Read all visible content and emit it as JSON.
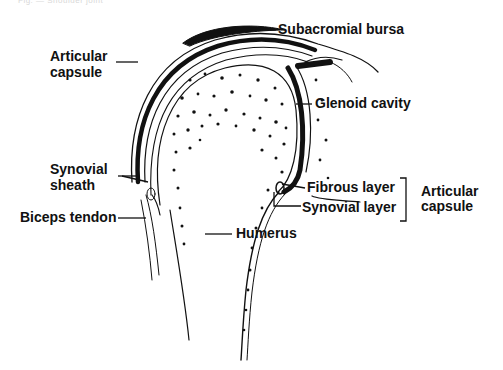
{
  "header_faint_text": "Fig. — Shoulder joint",
  "diagram": {
    "labels": {
      "subacromial_bursa": "Subacromial bursa",
      "articular_capsule_left_1": "Articular",
      "articular_capsule_left_2": "capsule",
      "glenoid_cavity": "Glenoid cavity",
      "synovial_sheath_1": "Synovial",
      "synovial_sheath_2": "sheath",
      "fibrous_layer": "Fibrous layer",
      "synovial_layer": "Synovial layer",
      "articular_capsule_right_1": "Articular",
      "articular_capsule_right_2": "capsule",
      "biceps_tendon": "Biceps tendon",
      "humerus": "Humerus"
    }
  }
}
